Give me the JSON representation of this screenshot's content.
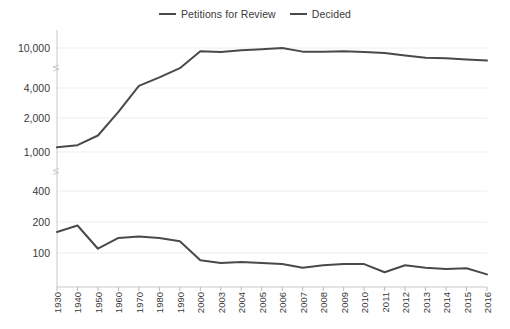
{
  "legend": {
    "position": "top-center",
    "items": [
      {
        "label": "Petitions for Review",
        "color": "#4a4a4a",
        "icon": "line-swatch-icon"
      },
      {
        "label": "Decided",
        "color": "#4a4a4a",
        "icon": "line-swatch-icon"
      }
    ]
  },
  "axes": {
    "y_scale": "log-with-breaks",
    "y_ticks": [
      "100",
      "200",
      "400",
      "1,000",
      "2,000",
      "4,000",
      "10,000"
    ],
    "x_ticks": [
      "1930",
      "1940",
      "1950",
      "1960",
      "1970",
      "1980",
      "1990",
      "2000",
      "2003",
      "2004",
      "2005",
      "2006",
      "2007",
      "2008",
      "2009",
      "2010",
      "2011",
      "2012",
      "2013",
      "2014",
      "2015",
      "2016"
    ],
    "grid": true
  },
  "chart_data": {
    "type": "line",
    "title": "",
    "subtitle": "",
    "xlabel": "",
    "ylabel": "",
    "yscale": "log",
    "ylim": [
      60,
      12000
    ],
    "y_tick_values": [
      100,
      200,
      400,
      1000,
      2000,
      4000,
      10000
    ],
    "y_tick_labels": [
      "100",
      "200",
      "400",
      "1,000",
      "2,000",
      "4,000",
      "10,000"
    ],
    "axis_breaks": [
      [
        400,
        1000
      ],
      [
        4000,
        10000
      ]
    ],
    "legend_position": "top-center",
    "grid": true,
    "categories": [
      "1930",
      "1940",
      "1950",
      "1960",
      "1970",
      "1980",
      "1990",
      "2000",
      "2003",
      "2004",
      "2005",
      "2006",
      "2007",
      "2008",
      "2009",
      "2010",
      "2011",
      "2012",
      "2013",
      "2014",
      "2015",
      "2016"
    ],
    "series": [
      {
        "name": "Petitions for Review",
        "color": "#4a4a4a",
        "values": [
          1100,
          1150,
          1400,
          2300,
          4200,
          5100,
          6300,
          9300,
          9100,
          9500,
          9700,
          10000,
          9200,
          9200,
          9300,
          9100,
          8900,
          8400,
          8000,
          7900,
          7700,
          7500
        ]
      },
      {
        "name": "Decided",
        "color": "#4a4a4a",
        "values": [
          160,
          185,
          110,
          140,
          145,
          140,
          130,
          85,
          80,
          82,
          80,
          78,
          72,
          76,
          78,
          78,
          65,
          76,
          72,
          70,
          71,
          62
        ]
      }
    ]
  }
}
